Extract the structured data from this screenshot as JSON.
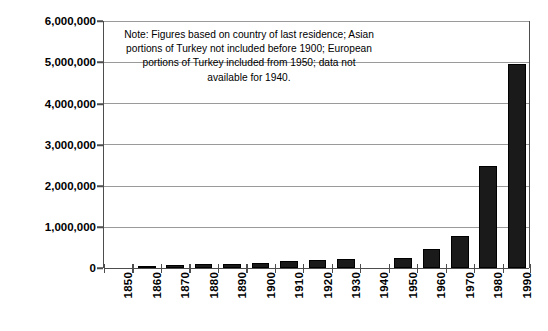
{
  "chart_data": {
    "type": "bar",
    "title": "",
    "subtitle": "",
    "xlabel": "",
    "ylabel": "",
    "categories": [
      "1850",
      "1860",
      "1870",
      "1880",
      "1890",
      "1900",
      "1910",
      "1920",
      "1930",
      "1940",
      "1950",
      "1960",
      "1970",
      "1980",
      "1990"
    ],
    "values": [
      0,
      50000,
      70000,
      90000,
      100000,
      120000,
      170000,
      200000,
      210000,
      null,
      250000,
      460000,
      780000,
      2480000,
      4950000
    ],
    "ylim": [
      0,
      6000000
    ],
    "ytick_labels": [
      "0",
      "1,000,000",
      "2,000,000",
      "3,000,000",
      "4,000,000",
      "5,000,000",
      "6,000,000"
    ],
    "ytick_values": [
      0,
      1000000,
      2000000,
      3000000,
      4000000,
      5000000,
      6000000
    ],
    "grid": true,
    "legend": false,
    "bar_color": "#1a1a1a",
    "axis_color": "#4d4d4d",
    "grid_color": "#9a9a9a",
    "missing_note": "data not available for 1940",
    "annotations": [
      {
        "name": "figures-note",
        "text": "Note: Figures based on country of last residence; Asian portions of Turkey not included before 1900;  European portions of Turkey included from 1950; data not available for 1940."
      }
    ]
  }
}
